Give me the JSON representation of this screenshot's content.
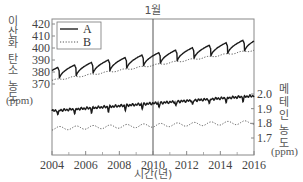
{
  "chart_data": {
    "type": "line",
    "title": "",
    "annotation": "1월",
    "annotation_x": 2010,
    "xlabel": "시간(년)",
    "x_ticks": [
      2004,
      2006,
      2008,
      2010,
      2012,
      2014,
      2016
    ],
    "x_minor_ticks": [
      2005,
      2007,
      2009,
      2011,
      2013,
      2015
    ],
    "xlim": [
      2004,
      2016
    ],
    "y_left": {
      "label_chars": [
        "이",
        "산",
        "화",
        "탄",
        "소",
        "농",
        "도"
      ],
      "label": "이산화 탄소 농도",
      "unit": "(ppm)",
      "ticks": [
        370,
        380,
        390,
        400,
        410,
        420
      ],
      "ylim": [
        360,
        424
      ]
    },
    "y_right": {
      "label_chars": [
        "메",
        "테",
        "인",
        "농",
        "도"
      ],
      "label": "메테인 농도",
      "unit": "(ppm)",
      "ticks": [
        1.7,
        1.8,
        1.9,
        2.0
      ],
      "ylim": [
        1.6,
        2.03
      ]
    },
    "legend": {
      "position": "upper-left",
      "entries": [
        {
          "label": "A",
          "style": "solid"
        },
        {
          "label": "B",
          "style": "dotted"
        }
      ]
    },
    "series": [
      {
        "name": "A",
        "axis": "left",
        "style": "solid",
        "description": "CO2 seasonal cycle with sharp annual dips",
        "points": [
          {
            "x": 2004.0,
            "y": 385
          },
          {
            "x": 2004.4,
            "y": 374
          },
          {
            "x": 2004.9,
            "y": 388
          },
          {
            "x": 2005.4,
            "y": 376
          },
          {
            "x": 2005.9,
            "y": 390
          },
          {
            "x": 2006.4,
            "y": 378
          },
          {
            "x": 2006.9,
            "y": 392
          },
          {
            "x": 2007.4,
            "y": 380
          },
          {
            "x": 2007.9,
            "y": 394
          },
          {
            "x": 2008.4,
            "y": 382
          },
          {
            "x": 2008.9,
            "y": 395
          },
          {
            "x": 2009.4,
            "y": 383
          },
          {
            "x": 2009.9,
            "y": 397
          },
          {
            "x": 2010.4,
            "y": 385
          },
          {
            "x": 2010.9,
            "y": 399
          },
          {
            "x": 2011.4,
            "y": 387
          },
          {
            "x": 2011.9,
            "y": 401
          },
          {
            "x": 2012.4,
            "y": 389
          },
          {
            "x": 2012.9,
            "y": 403
          },
          {
            "x": 2013.4,
            "y": 391
          },
          {
            "x": 2013.9,
            "y": 406
          },
          {
            "x": 2014.4,
            "y": 393
          },
          {
            "x": 2014.9,
            "y": 408
          },
          {
            "x": 2015.4,
            "y": 396
          },
          {
            "x": 2016.0,
            "y": 412
          }
        ]
      },
      {
        "name": "B",
        "axis": "left",
        "style": "dotted",
        "description": "CO2 long-term trend (smoothed)",
        "points": [
          {
            "x": 2004.0,
            "y": 372
          },
          {
            "x": 2006.0,
            "y": 378
          },
          {
            "x": 2008.0,
            "y": 382
          },
          {
            "x": 2010.0,
            "y": 387
          },
          {
            "x": 2012.0,
            "y": 391
          },
          {
            "x": 2014.0,
            "y": 395
          },
          {
            "x": 2016.0,
            "y": 400
          }
        ]
      },
      {
        "name": "A",
        "axis": "right",
        "style": "solid",
        "description": "Methane seasonal cycle",
        "points": [
          {
            "x": 2004.0,
            "y": 1.88
          },
          {
            "x": 2004.5,
            "y": 1.86
          },
          {
            "x": 2005.0,
            "y": 1.89
          },
          {
            "x": 2005.5,
            "y": 1.87
          },
          {
            "x": 2006.0,
            "y": 1.89
          },
          {
            "x": 2006.5,
            "y": 1.87
          },
          {
            "x": 2007.0,
            "y": 1.9
          },
          {
            "x": 2008.0,
            "y": 1.91
          },
          {
            "x": 2009.0,
            "y": 1.92
          },
          {
            "x": 2010.0,
            "y": 1.92
          },
          {
            "x": 2011.0,
            "y": 1.91
          },
          {
            "x": 2012.0,
            "y": 1.93
          },
          {
            "x": 2013.0,
            "y": 1.94
          },
          {
            "x": 2014.0,
            "y": 1.95
          },
          {
            "x": 2015.0,
            "y": 1.97
          },
          {
            "x": 2016.0,
            "y": 1.99
          }
        ]
      },
      {
        "name": "B",
        "axis": "right",
        "style": "dotted",
        "description": "Methane long-term trend",
        "points": [
          {
            "x": 2004.0,
            "y": 1.76
          },
          {
            "x": 2006.0,
            "y": 1.77
          },
          {
            "x": 2008.0,
            "y": 1.78
          },
          {
            "x": 2010.0,
            "y": 1.78
          },
          {
            "x": 2012.0,
            "y": 1.79
          },
          {
            "x": 2014.0,
            "y": 1.8
          },
          {
            "x": 2016.0,
            "y": 1.8
          }
        ]
      }
    ],
    "grid": false
  }
}
